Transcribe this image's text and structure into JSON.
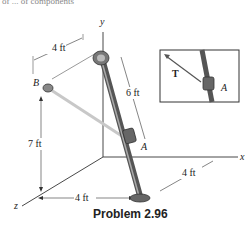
{
  "header_fragment": "of ... of components",
  "axes": {
    "x": "x",
    "y": "y",
    "z": "z"
  },
  "points": {
    "A": "A",
    "B": "B"
  },
  "dimensions": {
    "top": "4 ft",
    "rod_length": "6 ft",
    "height": "7 ft",
    "bottom_z": "4 ft",
    "bottom_x": "4 ft"
  },
  "inset": {
    "force": "T",
    "point": "A"
  },
  "caption": "Problem 2.96",
  "colors": {
    "rod": "#6b6b6b",
    "cable": "#c8c8c8",
    "line": "#333333"
  }
}
